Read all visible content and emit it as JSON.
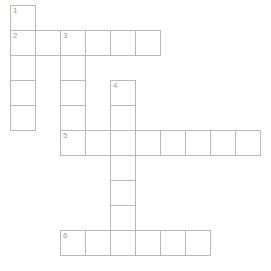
{
  "puzzle": {
    "type": "crossword-grid",
    "title": "",
    "grid": {
      "origin_x": 10,
      "origin_y": 5,
      "cell_size": 25,
      "columns": 10,
      "rows": 10,
      "line_color": "#b8b8b8",
      "cell_fill": "#ffffff",
      "number_color": "#9a9a9a",
      "background": "#ffffff"
    },
    "entries": [
      {
        "number": "1",
        "direction": "down",
        "col": 0,
        "row": 0,
        "length": 5
      },
      {
        "number": "2",
        "direction": "across",
        "col": 0,
        "row": 1,
        "length": 6
      },
      {
        "number": "3",
        "direction": "down",
        "col": 2,
        "row": 1,
        "length": 5
      },
      {
        "number": "4",
        "direction": "down",
        "col": 4,
        "row": 3,
        "length": 7
      },
      {
        "number": "5",
        "direction": "across",
        "col": 2,
        "row": 5,
        "length": 8
      },
      {
        "number": "6",
        "direction": "across",
        "col": 2,
        "row": 9,
        "length": 6
      }
    ],
    "cells": [
      {
        "col": 0,
        "row": 0,
        "number": "1",
        "letter": ""
      },
      {
        "col": 0,
        "row": 1,
        "number": "2",
        "letter": ""
      },
      {
        "col": 1,
        "row": 1,
        "number": "",
        "letter": ""
      },
      {
        "col": 2,
        "row": 1,
        "number": "3",
        "letter": ""
      },
      {
        "col": 3,
        "row": 1,
        "number": "",
        "letter": ""
      },
      {
        "col": 4,
        "row": 1,
        "number": "",
        "letter": ""
      },
      {
        "col": 5,
        "row": 1,
        "number": "",
        "letter": ""
      },
      {
        "col": 0,
        "row": 2,
        "number": "",
        "letter": ""
      },
      {
        "col": 2,
        "row": 2,
        "number": "",
        "letter": ""
      },
      {
        "col": 0,
        "row": 3,
        "number": "",
        "letter": ""
      },
      {
        "col": 2,
        "row": 3,
        "number": "",
        "letter": ""
      },
      {
        "col": 4,
        "row": 3,
        "number": "4",
        "letter": ""
      },
      {
        "col": 0,
        "row": 4,
        "number": "",
        "letter": ""
      },
      {
        "col": 2,
        "row": 4,
        "number": "",
        "letter": ""
      },
      {
        "col": 4,
        "row": 4,
        "number": "",
        "letter": ""
      },
      {
        "col": 2,
        "row": 5,
        "number": "5",
        "letter": ""
      },
      {
        "col": 3,
        "row": 5,
        "number": "",
        "letter": ""
      },
      {
        "col": 4,
        "row": 5,
        "number": "",
        "letter": ""
      },
      {
        "col": 5,
        "row": 5,
        "number": "",
        "letter": ""
      },
      {
        "col": 6,
        "row": 5,
        "number": "",
        "letter": ""
      },
      {
        "col": 7,
        "row": 5,
        "number": "",
        "letter": ""
      },
      {
        "col": 8,
        "row": 5,
        "number": "",
        "letter": ""
      },
      {
        "col": 9,
        "row": 5,
        "number": "",
        "letter": ""
      },
      {
        "col": 4,
        "row": 6,
        "number": "",
        "letter": ""
      },
      {
        "col": 4,
        "row": 7,
        "number": "",
        "letter": ""
      },
      {
        "col": 4,
        "row": 8,
        "number": "",
        "letter": ""
      },
      {
        "col": 2,
        "row": 9,
        "number": "6",
        "letter": ""
      },
      {
        "col": 3,
        "row": 9,
        "number": "",
        "letter": ""
      },
      {
        "col": 4,
        "row": 9,
        "number": "",
        "letter": ""
      },
      {
        "col": 5,
        "row": 9,
        "number": "",
        "letter": ""
      },
      {
        "col": 6,
        "row": 9,
        "number": "",
        "letter": ""
      },
      {
        "col": 7,
        "row": 9,
        "number": "",
        "letter": ""
      }
    ]
  }
}
